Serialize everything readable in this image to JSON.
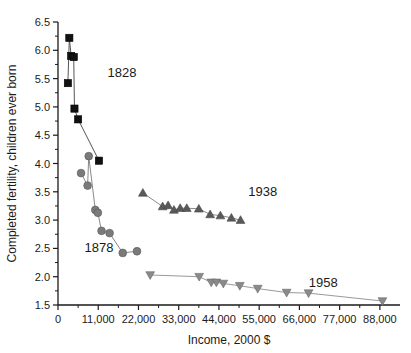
{
  "chart_data": {
    "type": "scatter",
    "title": "",
    "xlabel": "Income, 2000 $",
    "ylabel": "Completed fertility, children ever born",
    "xlim": [
      0,
      93500
    ],
    "ylim": [
      1.5,
      6.5
    ],
    "grid": false,
    "legend_position": "inline-annotations",
    "x_ticks": [
      0,
      11000,
      22000,
      33000,
      44000,
      55000,
      66000,
      77000,
      88000
    ],
    "x_tick_labels": [
      "0",
      "11,000",
      "22,000",
      "33,000",
      "44,000",
      "55,000",
      "66,000",
      "77,000",
      "88,000"
    ],
    "x_minor_step": 5500,
    "y_ticks": [
      1.5,
      2.0,
      2.5,
      3.0,
      3.5,
      4.0,
      4.5,
      5.0,
      5.5,
      6.0,
      6.5
    ],
    "y_tick_labels": [
      "1.5",
      "2.0",
      "2.5",
      "3.0",
      "3.5",
      "4.0",
      "4.5",
      "5.0",
      "5.5",
      "6.0",
      "6.5"
    ],
    "y_minor_step": 0.25,
    "series": [
      {
        "name": "1828",
        "marker": "square",
        "color": "#111111",
        "line_color": "#555555",
        "annotation": "1828",
        "annotation_x": 17500,
        "annotation_y": 5.52,
        "points": [
          {
            "x": 3100,
            "y": 6.22
          },
          {
            "x": 3600,
            "y": 5.9
          },
          {
            "x": 4300,
            "y": 5.88
          },
          {
            "x": 2700,
            "y": 5.42
          },
          {
            "x": 4500,
            "y": 4.97
          },
          {
            "x": 5500,
            "y": 4.78
          },
          {
            "x": 11200,
            "y": 4.05
          }
        ]
      },
      {
        "name": "1878",
        "marker": "circle",
        "color": "#7a7a7a",
        "line_color": "#888888",
        "annotation": "1878",
        "annotation_x": 11200,
        "annotation_y": 2.43,
        "points": [
          {
            "x": 8400,
            "y": 4.13
          },
          {
            "x": 6300,
            "y": 3.83
          },
          {
            "x": 8100,
            "y": 3.61
          },
          {
            "x": 10200,
            "y": 3.18
          },
          {
            "x": 10900,
            "y": 3.13
          },
          {
            "x": 11900,
            "y": 2.81
          },
          {
            "x": 14100,
            "y": 2.77
          },
          {
            "x": 17700,
            "y": 2.42
          },
          {
            "x": 21600,
            "y": 2.45
          }
        ]
      },
      {
        "name": "1938",
        "marker": "triangle-up",
        "color": "#595959",
        "line_color": "#8a8a8a",
        "annotation": "1938",
        "annotation_x": 56000,
        "annotation_y": 3.42,
        "points": [
          {
            "x": 23200,
            "y": 3.48
          },
          {
            "x": 28600,
            "y": 3.24
          },
          {
            "x": 30100,
            "y": 3.26
          },
          {
            "x": 31700,
            "y": 3.18
          },
          {
            "x": 33400,
            "y": 3.21
          },
          {
            "x": 35200,
            "y": 3.21
          },
          {
            "x": 38500,
            "y": 3.2
          },
          {
            "x": 41600,
            "y": 3.1
          },
          {
            "x": 44400,
            "y": 3.08
          },
          {
            "x": 47400,
            "y": 3.04
          },
          {
            "x": 49900,
            "y": 3.0
          }
        ]
      },
      {
        "name": "1958",
        "marker": "triangle-down",
        "color": "#8a8a8a",
        "line_color": "#9a9a9a",
        "annotation": "1958",
        "annotation_x": 72500,
        "annotation_y": 1.82,
        "points": [
          {
            "x": 25200,
            "y": 2.03
          },
          {
            "x": 38600,
            "y": 2.0
          },
          {
            "x": 41900,
            "y": 1.9
          },
          {
            "x": 43300,
            "y": 1.9
          },
          {
            "x": 45200,
            "y": 1.88
          },
          {
            "x": 49700,
            "y": 1.84
          },
          {
            "x": 54600,
            "y": 1.79
          },
          {
            "x": 62500,
            "y": 1.72
          },
          {
            "x": 68500,
            "y": 1.71
          },
          {
            "x": 88700,
            "y": 1.57
          }
        ]
      }
    ]
  }
}
